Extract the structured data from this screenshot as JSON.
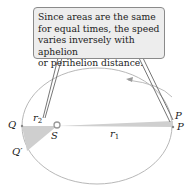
{
  "callout": {
    "lines": [
      "Since areas are the same",
      "for equal times, the speed",
      "varies inversely with aphelion",
      "or perihelion distance."
    ]
  },
  "labels": {
    "Q": "Q",
    "Q_prime": "Q",
    "prime_mark": "′",
    "S": "S",
    "P_upper": "P",
    "P_lower": "P",
    "r1": "r",
    "r1_sub": "1",
    "r2": "r",
    "r2_sub": "2"
  },
  "colors": {
    "orbit": "#b8b8b8",
    "sector_fill": "#cfcfcf",
    "callout_bg": "#ededed",
    "callout_border": "#8a8a8a",
    "text": "#222222"
  }
}
